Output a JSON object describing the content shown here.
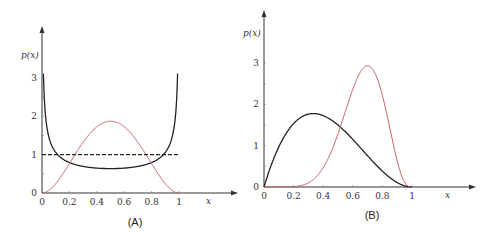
{
  "chart_data": [
    {
      "type": "line",
      "panel_label": "(A)",
      "xlabel": "x",
      "ylabel": "p(x)",
      "xlim": [
        0,
        1
      ],
      "ylim": [
        0,
        3.4
      ],
      "x_ticks": [
        "0",
        "0.2",
        "0.4",
        "0.6",
        "0.8",
        "1"
      ],
      "y_ticks": [
        "0",
        "1",
        "2",
        "3"
      ],
      "grid": false,
      "series": [
        {
          "name": "Beta(0.5,0.5)",
          "color": "#222222",
          "style": "solid",
          "x": [
            0.01,
            0.03,
            0.05,
            0.1,
            0.2,
            0.3,
            0.4,
            0.5,
            0.6,
            0.7,
            0.8,
            0.9,
            0.95,
            0.97,
            0.99
          ],
          "values": [
            3.2,
            1.87,
            1.46,
            1.06,
            0.8,
            0.69,
            0.65,
            0.64,
            0.65,
            0.69,
            0.8,
            1.06,
            1.46,
            1.87,
            3.2
          ]
        },
        {
          "name": "Beta(3,3)",
          "color": "#c06060",
          "style": "solid",
          "x": [
            0,
            0.1,
            0.2,
            0.3,
            0.4,
            0.5,
            0.6,
            0.7,
            0.8,
            0.9,
            1
          ],
          "values": [
            0,
            0.24,
            0.77,
            1.32,
            1.73,
            1.875,
            1.73,
            1.32,
            0.77,
            0.24,
            0
          ]
        },
        {
          "name": "Uniform",
          "color": "#222222",
          "style": "dashed",
          "x": [
            0,
            1
          ],
          "values": [
            1,
            1
          ]
        }
      ]
    },
    {
      "type": "line",
      "panel_label": "(B)",
      "xlabel": "x",
      "ylabel": "p(x)",
      "xlim": [
        0,
        1
      ],
      "ylim": [
        0,
        3.4
      ],
      "x_ticks": [
        "0",
        "0.2",
        "0.4",
        "0.6",
        "0.8",
        "1"
      ],
      "y_ticks": [
        "0",
        "1",
        "2",
        "3"
      ],
      "grid": false,
      "series": [
        {
          "name": "Beta(2,3)",
          "color": "#222222",
          "style": "solid",
          "x": [
            0,
            0.1,
            0.2,
            0.3,
            0.333,
            0.4,
            0.5,
            0.6,
            0.7,
            0.8,
            0.9,
            1
          ],
          "values": [
            0,
            0.97,
            1.54,
            1.76,
            1.78,
            1.73,
            1.5,
            1.15,
            0.76,
            0.38,
            0.11,
            0
          ]
        },
        {
          "name": "Beta(8,4)",
          "color": "#c06060",
          "style": "solid",
          "x": [
            0,
            0.2,
            0.3,
            0.4,
            0.5,
            0.6,
            0.7,
            0.8,
            0.9,
            1
          ],
          "values": [
            0,
            0.03,
            0.18,
            0.63,
            1.42,
            2.42,
            2.96,
            2.5,
            1.02,
            0
          ]
        }
      ]
    }
  ]
}
